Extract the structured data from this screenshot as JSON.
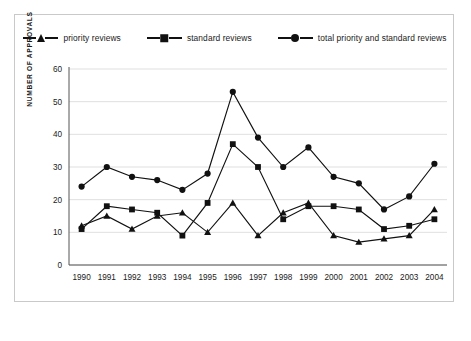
{
  "chart_data": {
    "type": "line",
    "title": "",
    "xlabel": "",
    "ylabel": "NUMBER OF APPROVALS",
    "ylim": [
      0,
      60
    ],
    "yticks": [
      0,
      10,
      20,
      30,
      40,
      50,
      60
    ],
    "grid": true,
    "legend_position": "top-center",
    "categories": [
      "1990",
      "1991",
      "1992",
      "1993",
      "1994",
      "1995",
      "1996",
      "1997",
      "1998",
      "1999",
      "2000",
      "2001",
      "2002",
      "2003",
      "2004"
    ],
    "series": [
      {
        "name": "priority reviews",
        "marker": "triangle",
        "values": [
          12,
          15,
          11,
          15,
          16,
          10,
          19,
          9,
          16,
          19,
          9,
          7,
          8,
          9,
          17
        ]
      },
      {
        "name": "standard reviews",
        "marker": "square",
        "values": [
          11,
          18,
          17,
          16,
          9,
          19,
          37,
          30,
          14,
          18,
          18,
          17,
          11,
          12,
          14
        ]
      },
      {
        "name": "total priority and standard reviews",
        "marker": "circle",
        "values": [
          24,
          30,
          27,
          26,
          23,
          28,
          53,
          39,
          30,
          36,
          27,
          25,
          17,
          21,
          31
        ]
      }
    ]
  },
  "legend": {
    "items": [
      {
        "label": "priority reviews",
        "marker": "triangle-marker"
      },
      {
        "label": "standard reviews",
        "marker": "square-marker"
      },
      {
        "label": "total priority and standard reviews",
        "marker": "circle-marker"
      }
    ]
  },
  "axis": {
    "y_title": "NUMBER OF APPROVALS",
    "y_ticks": [
      "0",
      "10",
      "20",
      "30",
      "40",
      "50",
      "60"
    ],
    "x_ticks": [
      "1990",
      "1991",
      "1992",
      "1993",
      "1994",
      "1995",
      "1996",
      "1997",
      "1998",
      "1999",
      "2000",
      "2001",
      "2002",
      "2003",
      "2004"
    ]
  },
  "colors": {
    "ink": "#111111",
    "grid": "#d7d7d7",
    "axis": "#555555",
    "frame": "#c9c9c9",
    "background": "#ffffff"
  }
}
